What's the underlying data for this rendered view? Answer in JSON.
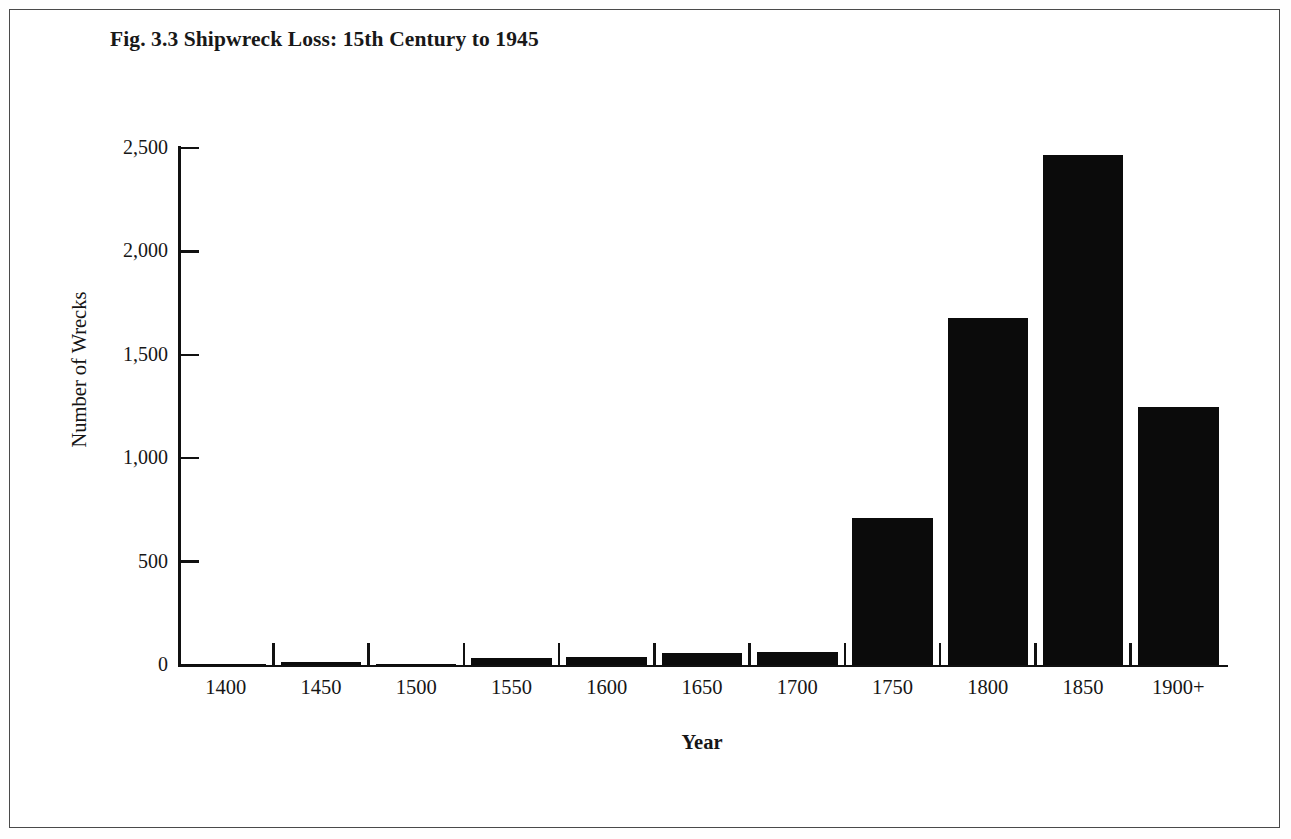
{
  "figure": {
    "title": "Fig. 3.3 Shipwreck Loss: 15th Century to 1945",
    "border_color": "#4a4a4a",
    "background": "#ffffff"
  },
  "chart_data": {
    "type": "bar",
    "title": "Fig. 3.3 Shipwreck Loss: 15th Century to 1945",
    "xlabel": "Year",
    "ylabel": "Number of Wrecks",
    "categories": [
      "1400",
      "1450",
      "1500",
      "1550",
      "1600",
      "1650",
      "1700",
      "1750",
      "1800",
      "1850",
      "1900+"
    ],
    "values": [
      2,
      15,
      5,
      32,
      40,
      58,
      62,
      711,
      1680,
      2465,
      1250
    ],
    "ylim": [
      0,
      2500
    ],
    "yticks": [
      0,
      500,
      1000,
      1500,
      2000,
      2500
    ],
    "ytick_labels": [
      "0",
      "500",
      "1,000",
      "1,500",
      "2,000",
      "2,500"
    ],
    "grid": false,
    "legend": false,
    "bar_color": "#0b0b0b",
    "axis_color": "#111111"
  }
}
